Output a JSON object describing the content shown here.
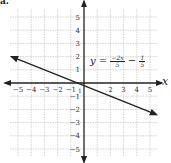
{
  "corner_label": "a.",
  "chart_data": {
    "type": "line",
    "title": "",
    "xlabel": "x",
    "ylabel": "y",
    "xlim": [
      -5.5,
      5.5
    ],
    "ylim": [
      -5.5,
      5.5
    ],
    "grid": true,
    "x_ticks": [
      -5,
      -4,
      -3,
      -2,
      -1,
      2,
      3,
      4,
      5
    ],
    "y_ticks": [
      5,
      4,
      3,
      2,
      1,
      -1,
      -2,
      -3,
      -4,
      -5
    ],
    "series": [
      {
        "name": "y = -2x/5 - 1/5",
        "equation": "y = -2x/5 - 1/5",
        "slope": -0.4,
        "intercept": -0.2,
        "x": [
          -5.5,
          5.5
        ],
        "y": [
          2.0,
          -2.4
        ]
      }
    ],
    "annotations": [
      {
        "text": "y = -2x/5 - 1/5",
        "x": 0.5,
        "y": 1.5
      }
    ]
  },
  "equation": {
    "lhs": "y =",
    "num1": "−2x",
    "den1": "5",
    "op": "−",
    "num2": "1",
    "den2": "5"
  },
  "colors": {
    "line": "#222222",
    "grid": "#b8b8b8",
    "axis": "#222222"
  }
}
